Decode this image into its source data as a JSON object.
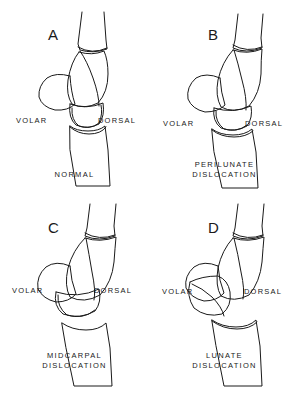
{
  "figure": {
    "type": "medical-line-drawing",
    "background_color": "#ffffff",
    "line_color": "#1a1a1a",
    "layout": "2x2 grid",
    "panel_count": 4
  },
  "orientation_labels": {
    "volar": "VOLAR",
    "dorsal": "DORSAL"
  },
  "panels": [
    {
      "letter": "A",
      "caption_lines": [
        "NORMAL"
      ],
      "volar": "VOLAR",
      "dorsal": "DORSAL",
      "description": "Normal carpal alignment: radius, lunate and capitate colinear"
    },
    {
      "letter": "B",
      "caption_lines": [
        "PERILUNATE",
        "DISLOCATION"
      ],
      "volar": "VOLAR",
      "dorsal": "DORSAL",
      "description": "Capitate displaced dorsally; lunate remains aligned with radius"
    },
    {
      "letter": "C",
      "caption_lines": [
        "MIDCARPAL",
        "DISLOCATION"
      ],
      "volar": "VOLAR",
      "dorsal": "DORSAL",
      "description": "Disruption at the midcarpal joint between lunate and capitate"
    },
    {
      "letter": "D",
      "caption_lines": [
        "LUNATE",
        "DISLOCATION"
      ],
      "volar": "VOLAR",
      "dorsal": "DORSAL",
      "description": "Lunate rotated and displaced volarly out of the radial fossa"
    }
  ]
}
